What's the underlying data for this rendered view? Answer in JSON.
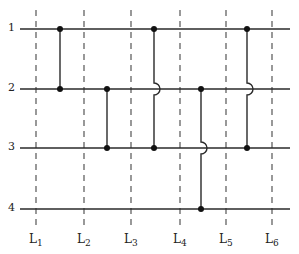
{
  "diagram": {
    "rows": [
      {
        "label": "1",
        "y": 29
      },
      {
        "label": "2",
        "y": 89
      },
      {
        "label": "3",
        "y": 148
      },
      {
        "label": "4",
        "y": 209
      }
    ],
    "row_line_x": [
      20,
      290
    ],
    "columns": [
      {
        "label": "L",
        "sub": "1",
        "x": 36
      },
      {
        "label": "L",
        "sub": "2",
        "x": 84
      },
      {
        "label": "L",
        "sub": "3",
        "x": 131
      },
      {
        "label": "L",
        "sub": "4",
        "x": 180
      },
      {
        "label": "L",
        "sub": "5",
        "x": 226
      },
      {
        "label": "L",
        "sub": "6",
        "x": 272
      }
    ],
    "column_line_y": [
      10,
      226
    ],
    "connections": [
      {
        "x": 60,
        "from_row": 1,
        "to_row": 2,
        "crosses": []
      },
      {
        "x": 107,
        "from_row": 2,
        "to_row": 3,
        "crosses": []
      },
      {
        "x": 154,
        "from_row": 1,
        "to_row": 3,
        "crosses": [
          2
        ]
      },
      {
        "x": 201,
        "from_row": 2,
        "to_row": 4,
        "crosses": [
          3
        ]
      },
      {
        "x": 247,
        "from_row": 1,
        "to_row": 3,
        "crosses": [
          2
        ]
      }
    ],
    "colors": {
      "line": "#2a2a2a",
      "dash": "#555555",
      "dot": "#111111"
    }
  }
}
